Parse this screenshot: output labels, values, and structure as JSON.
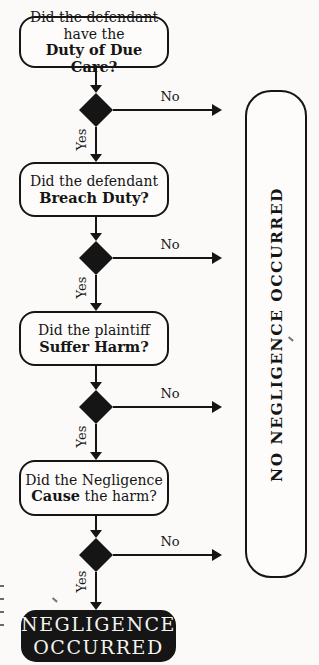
{
  "flow": {
    "steps": [
      {
        "line1": "Did the defendant",
        "line2": "have the",
        "line3_bold": "Duty of Due Care?"
      },
      {
        "line1": "Did the defendant",
        "line2_bold": "Breach Duty?"
      },
      {
        "line1": "Did the plaintiff",
        "line2_bold": "Suffer Harm?"
      },
      {
        "line1": "Did the Negligence",
        "line2_bold": "Cause",
        "line2_rest": " the harm?"
      }
    ],
    "labels": {
      "no": "No",
      "yes": "Yes"
    },
    "terminal_negative": "NO NEGLIGENCE OCCURRED",
    "terminal_positive_line1": "NEGLIGENCE",
    "terminal_positive_line2": "OCCURRED"
  },
  "colors": {
    "ink": "#151515",
    "paper": "#fbfaf8",
    "terminal_text": "#f5f3ef"
  }
}
